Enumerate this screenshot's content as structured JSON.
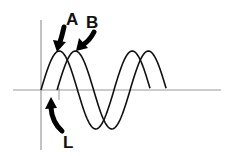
{
  "diagram": {
    "title": "",
    "labels": {
      "wave_a": "A",
      "wave_b": "B",
      "phase_lag": "L"
    },
    "waves": [
      {
        "name": "A",
        "cycles": 1.5,
        "phase_offset_cycles": 0.0
      },
      {
        "name": "B",
        "cycles": 1.5,
        "phase_offset_cycles": 0.22
      }
    ],
    "colors": {
      "wave": "#111111",
      "axis": "#999999",
      "arrow": "#000000",
      "label": "#111111"
    }
  }
}
